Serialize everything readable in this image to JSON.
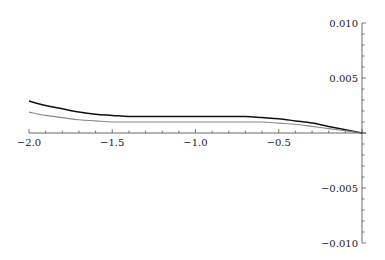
{
  "chart_data": {
    "type": "line",
    "title": "",
    "xlabel": "",
    "ylabel": "",
    "xlim": [
      -2.0,
      0.0
    ],
    "ylim": [
      -0.01,
      0.01
    ],
    "grid": false,
    "legend": null,
    "x_ticks": [
      -2.0,
      -1.5,
      -1.0,
      -0.5
    ],
    "x_tick_labels": [
      "-2.0",
      "-1.5",
      "-1.0",
      "-0.5"
    ],
    "y_ticks": [
      0.01,
      0.005,
      -0.005,
      -0.01
    ],
    "y_tick_labels": [
      "0.010",
      "0.005",
      "-0.005",
      "-0.010"
    ],
    "series": [
      {
        "name": "black curve",
        "color": "#111111",
        "x": [
          -2.0,
          -1.9,
          -1.8,
          -1.7,
          -1.6,
          -1.5,
          -1.4,
          -1.3,
          -1.2,
          -1.1,
          -1.0,
          -0.9,
          -0.8,
          -0.7,
          -0.6,
          -0.5,
          -0.4,
          -0.3,
          -0.2,
          -0.1,
          0.0
        ],
        "values": [
          0.0029,
          0.0025,
          0.0022,
          0.0019,
          0.0017,
          0.0016,
          0.0015,
          0.0015,
          0.0015,
          0.0015,
          0.0015,
          0.0015,
          0.0015,
          0.0015,
          0.0014,
          0.0013,
          0.0011,
          0.0009,
          0.0006,
          0.0003,
          0.0
        ]
      },
      {
        "name": "gray curve",
        "color": "#888888",
        "x": [
          -2.0,
          -1.9,
          -1.8,
          -1.7,
          -1.6,
          -1.5,
          -1.4,
          -1.3,
          -1.2,
          -1.1,
          -1.0,
          -0.9,
          -0.8,
          -0.7,
          -0.6,
          -0.5,
          -0.4,
          -0.3,
          -0.2,
          -0.1,
          0.0
        ],
        "values": [
          0.0019,
          0.0016,
          0.0014,
          0.0012,
          0.0011,
          0.001,
          0.001,
          0.001,
          0.001,
          0.001,
          0.001,
          0.001,
          0.001,
          0.001,
          0.001,
          0.0009,
          0.0008,
          0.0006,
          0.0004,
          0.0002,
          0.0
        ]
      }
    ]
  }
}
